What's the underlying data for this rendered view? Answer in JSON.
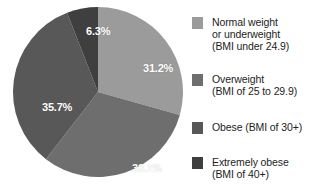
{
  "chart_data": {
    "type": "pie",
    "title": "",
    "subtitle": "",
    "xlabel": "",
    "ylabel": "",
    "grid": false,
    "legend_position": "right",
    "start_angle_deg": 0,
    "direction": "clockwise",
    "categories": [
      "Normal weight or underweight (BMI under 24.9)",
      "Overweight (BMI of 25 to 29.9)",
      "Obese (BMI of 30+)",
      "Extremely obese (BMI of 40+)"
    ],
    "values": [
      31.2,
      33.1,
      35.7,
      6.3
    ],
    "value_labels": [
      "31.2%",
      "33.1%",
      "35.7%",
      "6.3%"
    ],
    "colors": [
      "#9b9b9b",
      "#6e6e6e",
      "#585858",
      "#3f3f3f"
    ],
    "label_color": "#ffffff",
    "background": "#ffffff",
    "slices": [
      {
        "name": "Normal weight or underweight (BMI under 24.9)",
        "value": 31.2,
        "label": "31.2%",
        "color": "#9b9b9b",
        "label_x": 143,
        "label_y": 62
      },
      {
        "name": "Overweight (BMI of 25 to 29.9)",
        "value": 33.1,
        "label": "33.1%",
        "color": "#6e6e6e",
        "label_x": 132,
        "label_y": 162
      },
      {
        "name": "Obese (BMI of 30+)",
        "value": 35.7,
        "label": "35.7%",
        "color": "#585858",
        "label_x": 42,
        "label_y": 101
      },
      {
        "name": "Extremely obese (BMI of 40+)",
        "value": 6.3,
        "label": "6.3%",
        "color": "#3f3f3f",
        "label_x": 86,
        "label_y": 25
      }
    ]
  },
  "legend": {
    "items": [
      {
        "label": "Normal weight\nor underweight\n(BMI under 24.9)",
        "color": "#9b9b9b"
      },
      {
        "label": "Overweight\n(BMI of 25 to 29.9)",
        "color": "#6e6e6e"
      },
      {
        "label": "Obese (BMI of 30+)",
        "color": "#585858"
      },
      {
        "label": "Extremely obese\n(BMI of 40+)",
        "color": "#3f3f3f"
      }
    ]
  }
}
